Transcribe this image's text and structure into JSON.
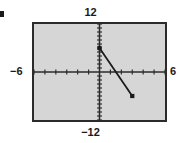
{
  "figure": {
    "bullet_icon": "square-bullet-icon",
    "labels": {
      "y_max": "12",
      "y_min": "−12",
      "x_min": "−6",
      "x_max": "6"
    }
  },
  "chart_data": {
    "type": "line",
    "title": "",
    "xlabel": "",
    "ylabel": "",
    "xlim": [
      -6,
      6
    ],
    "ylim": [
      -12,
      12
    ],
    "xtick_step": 1,
    "ytick_step": 1,
    "grid": false,
    "legend": "none",
    "plot_background": "#d6d6d6",
    "frame_color": "#2b2b2b",
    "line_color": "#1a1a1a",
    "marker": "square",
    "series": [
      {
        "name": "segment",
        "points": [
          {
            "x": 0,
            "y": 6
          },
          {
            "x": 3,
            "y": -6
          }
        ],
        "slope": -4,
        "intercept": 6
      }
    ],
    "tick_labels": {
      "top": "12",
      "bottom": "-12",
      "left": "-6",
      "right": "6"
    },
    "annotations": []
  }
}
